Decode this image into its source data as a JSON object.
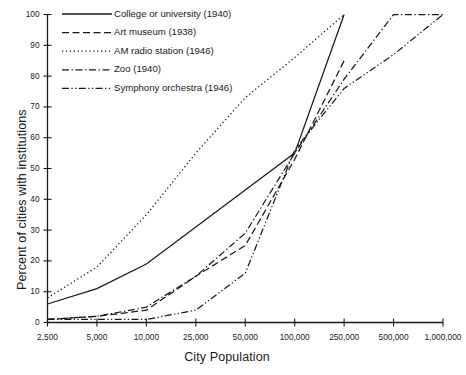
{
  "chart_data": {
    "type": "line",
    "title": "",
    "xlabel": "City Population",
    "ylabel": "Percent of cities with institutions",
    "categories": [
      "2,500",
      "5,000",
      "10,000",
      "25,000",
      "50,000",
      "100,000",
      "250,000",
      "500,000",
      "1,000,000"
    ],
    "x_numeric": [
      2500,
      5000,
      10000,
      25000,
      50000,
      100000,
      250000,
      500000,
      1000000
    ],
    "ylim": [
      0,
      100
    ],
    "y_ticks": [
      0,
      10,
      20,
      30,
      40,
      50,
      60,
      70,
      80,
      90,
      100
    ],
    "grid": false,
    "legend_position": "top-left",
    "series": [
      {
        "name": "College or university (1940)",
        "style": "solid",
        "values": [
          6,
          11,
          19,
          31,
          43,
          55,
          100,
          null,
          null
        ]
      },
      {
        "name": "Art museum (1938)",
        "style": "dashed",
        "values": [
          1,
          2,
          4,
          15,
          25,
          53,
          85,
          null,
          null
        ]
      },
      {
        "name": "AM radio station (1946)",
        "style": "dotted",
        "values": [
          8,
          18,
          35,
          55,
          73,
          86,
          100,
          null,
          null
        ]
      },
      {
        "name": "Zoo (1940)",
        "style": "dashdot",
        "values": [
          1,
          2,
          5,
          15,
          29,
          55,
          79,
          100,
          100
        ]
      },
      {
        "name": "Symphony orchestra (1946)",
        "style": "dashdotdot",
        "values": [
          1,
          1,
          1,
          4,
          16,
          56,
          76,
          87,
          100
        ]
      }
    ]
  },
  "axes": {
    "y_tick_labels": [
      "0",
      "10",
      "20",
      "30",
      "40",
      "50",
      "60",
      "70",
      "80",
      "90",
      "100"
    ],
    "x_tick_labels": [
      "2,500",
      "5,000",
      "10,000",
      "25,000",
      "50,000",
      "100,000",
      "250,000",
      "500,000",
      "1,000,000"
    ],
    "x_title": "City Population",
    "y_title": "Percent of cities with institutions"
  },
  "legend": {
    "entries": [
      {
        "label": "College or university (1940)"
      },
      {
        "label": "Art museum (1938)"
      },
      {
        "label": "AM radio station (1946)"
      },
      {
        "label": "Zoo (1940)"
      },
      {
        "label": "Symphony orchestra (1946)"
      }
    ]
  },
  "colors": {
    "line": "#1a1a1a",
    "axis": "#1a1a1a",
    "background": "#ffffff"
  }
}
